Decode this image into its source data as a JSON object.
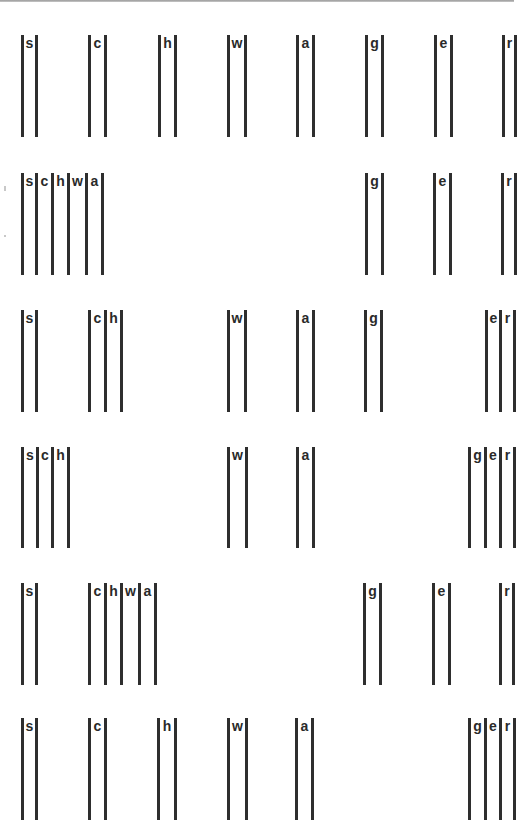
{
  "figure": {
    "bar_color": "#2e2e2e",
    "rows": [
      {
        "top": 35,
        "height": 102,
        "groups": [
          {
            "bars": [
              21,
              35
            ],
            "labels": [
              "s"
            ]
          },
          {
            "bars": [
              88,
              104
            ],
            "labels": [
              "c"
            ]
          },
          {
            "bars": [
              158,
              174
            ],
            "labels": [
              "h"
            ]
          },
          {
            "bars": [
              227,
              244
            ],
            "labels": [
              "w"
            ]
          },
          {
            "bars": [
              296,
              312
            ],
            "labels": [
              "a"
            ]
          },
          {
            "bars": [
              365,
              381
            ],
            "labels": [
              "g"
            ]
          },
          {
            "bars": [
              434,
              450
            ],
            "labels": [
              "e"
            ]
          },
          {
            "bars": [
              502,
              514
            ],
            "labels": [
              "r"
            ]
          }
        ]
      },
      {
        "top": 173,
        "height": 102,
        "groups": [
          {
            "bars": [
              21,
              35,
              51,
              67,
              85,
              101
            ],
            "labels": [
              "s",
              "c",
              "h",
              "w",
              "a"
            ]
          },
          {
            "bars": [
              365,
              381
            ],
            "labels": [
              "g"
            ]
          },
          {
            "bars": [
              433,
              449
            ],
            "labels": [
              "e"
            ]
          },
          {
            "bars": [
              501,
              514
            ],
            "labels": [
              "r"
            ]
          }
        ]
      },
      {
        "top": 310,
        "height": 102,
        "groups": [
          {
            "bars": [
              21,
              35
            ],
            "labels": [
              "s"
            ]
          },
          {
            "bars": [
              88,
              104,
              120
            ],
            "labels": [
              "c",
              "h"
            ]
          },
          {
            "bars": [
              227,
              244
            ],
            "labels": [
              "w"
            ]
          },
          {
            "bars": [
              296,
              312
            ],
            "labels": [
              "a"
            ]
          },
          {
            "bars": [
              364,
              380
            ],
            "labels": [
              "g"
            ]
          },
          {
            "bars": [
              485,
              499,
              513
            ],
            "labels": [
              "e",
              "r"
            ]
          }
        ]
      },
      {
        "top": 447,
        "height": 101,
        "groups": [
          {
            "bars": [
              21,
              36,
              51,
              67
            ],
            "labels": [
              "s",
              "c",
              "h"
            ]
          },
          {
            "bars": [
              227,
              245
            ],
            "labels": [
              "w"
            ]
          },
          {
            "bars": [
              296,
              312
            ],
            "labels": [
              "a"
            ]
          },
          {
            "bars": [
              468,
              484,
              499,
              513
            ],
            "labels": [
              "g",
              "e",
              "r"
            ]
          }
        ]
      },
      {
        "top": 583,
        "height": 102,
        "groups": [
          {
            "bars": [
              21,
              35
            ],
            "labels": [
              "s"
            ]
          },
          {
            "bars": [
              88,
              104,
              120,
              138,
              154
            ],
            "labels": [
              "c",
              "h",
              "w",
              "a"
            ]
          },
          {
            "bars": [
              363,
              379
            ],
            "labels": [
              "g"
            ]
          },
          {
            "bars": [
              432,
              448
            ],
            "labels": [
              "e"
            ]
          },
          {
            "bars": [
              499,
              512
            ],
            "labels": [
              "r"
            ]
          }
        ]
      },
      {
        "top": 718,
        "height": 102,
        "groups": [
          {
            "bars": [
              21,
              35
            ],
            "labels": [
              "s"
            ]
          },
          {
            "bars": [
              88,
              104
            ],
            "labels": [
              "c"
            ]
          },
          {
            "bars": [
              157,
              174
            ],
            "labels": [
              "h"
            ]
          },
          {
            "bars": [
              227,
              245
            ],
            "labels": [
              "w"
            ]
          },
          {
            "bars": [
              295,
              311
            ],
            "labels": [
              "a"
            ]
          },
          {
            "bars": [
              468,
              484,
              499,
              513
            ],
            "labels": [
              "g",
              "e",
              "r"
            ]
          }
        ]
      }
    ]
  }
}
